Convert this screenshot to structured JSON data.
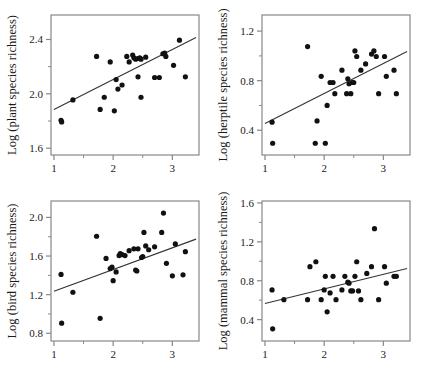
{
  "figure": {
    "background_color": "#ffffff",
    "point_color": "#111111",
    "line_color": "#333333",
    "axis_color": "#888888",
    "panel_count": 4
  },
  "chart_data": [
    {
      "type": "scatter",
      "title": "",
      "panel_name": "plant-species-richness",
      "xlabel": "",
      "ylabel": "Log (plant species richness)",
      "xlim": [
        0.95,
        3.45
      ],
      "ylim": [
        1.55,
        2.58
      ],
      "xticks": [
        1,
        2,
        3
      ],
      "xticklabels": [
        "1",
        "2",
        "3"
      ],
      "xminorticks": [
        1.5,
        2.5
      ],
      "yticks": [
        1.6,
        2.0,
        2.4
      ],
      "yticklabels": [
        "1.6",
        "2.0",
        "2.4"
      ],
      "yminorticks": [
        1.8,
        2.2
      ],
      "grid": false,
      "legend": "none",
      "regression": {
        "x": [
          1.0,
          3.4
        ],
        "y": [
          1.885,
          2.415
        ]
      },
      "points": [
        [
          1.12,
          1.805
        ],
        [
          1.13,
          1.793
        ],
        [
          1.32,
          1.955
        ],
        [
          1.72,
          2.275
        ],
        [
          1.78,
          1.885
        ],
        [
          1.85,
          1.975
        ],
        [
          1.95,
          2.235
        ],
        [
          2.02,
          1.875
        ],
        [
          2.05,
          2.105
        ],
        [
          2.08,
          2.035
        ],
        [
          2.15,
          2.065
        ],
        [
          2.23,
          2.275
        ],
        [
          2.27,
          2.235
        ],
        [
          2.33,
          2.285
        ],
        [
          2.35,
          2.265
        ],
        [
          2.38,
          2.255
        ],
        [
          2.42,
          2.26
        ],
        [
          2.45,
          2.265
        ],
        [
          2.47,
          2.255
        ],
        [
          2.47,
          1.975
        ],
        [
          2.42,
          2.125
        ],
        [
          2.55,
          2.27
        ],
        [
          2.7,
          2.12
        ],
        [
          2.78,
          2.12
        ],
        [
          2.84,
          2.295
        ],
        [
          2.87,
          2.3
        ],
        [
          2.89,
          2.275
        ],
        [
          3.02,
          2.21
        ],
        [
          3.12,
          2.395
        ],
        [
          3.22,
          2.125
        ]
      ]
    },
    {
      "type": "scatter",
      "title": "",
      "panel_name": "herptile-species-richness",
      "xlabel": "",
      "ylabel": "Log (herptile species richness)",
      "xlim": [
        0.95,
        3.45
      ],
      "ylim": [
        0.2,
        1.33
      ],
      "xticks": [
        1,
        2,
        3
      ],
      "xticklabels": [
        "1",
        "2",
        "3"
      ],
      "xminorticks": [
        1.5,
        2.5
      ],
      "yticks": [
        0.4,
        0.8,
        1.2
      ],
      "yticklabels": [
        "0.4",
        "0.8",
        "1.2"
      ],
      "yminorticks": [
        0.6,
        1.0
      ],
      "grid": false,
      "legend": "none",
      "regression": {
        "x": [
          1.0,
          3.4
        ],
        "y": [
          0.455,
          1.035
        ]
      },
      "points": [
        [
          1.12,
          0.465
        ],
        [
          1.13,
          0.295
        ],
        [
          1.72,
          1.075
        ],
        [
          1.85,
          0.295
        ],
        [
          1.88,
          0.475
        ],
        [
          1.95,
          0.835
        ],
        [
          2.02,
          0.295
        ],
        [
          2.05,
          0.6
        ],
        [
          2.1,
          0.785
        ],
        [
          2.15,
          0.785
        ],
        [
          2.18,
          0.695
        ],
        [
          2.3,
          0.885
        ],
        [
          2.38,
          0.695
        ],
        [
          2.4,
          0.815
        ],
        [
          2.42,
          0.775
        ],
        [
          2.45,
          0.695
        ],
        [
          2.47,
          0.785
        ],
        [
          2.5,
          0.785
        ],
        [
          2.52,
          1.04
        ],
        [
          2.55,
          0.995
        ],
        [
          2.62,
          0.885
        ],
        [
          2.7,
          0.935
        ],
        [
          2.8,
          1.015
        ],
        [
          2.84,
          1.04
        ],
        [
          2.88,
          0.995
        ],
        [
          2.92,
          0.695
        ],
        [
          3.02,
          0.995
        ],
        [
          3.05,
          0.835
        ],
        [
          3.18,
          0.885
        ],
        [
          3.22,
          0.695
        ]
      ]
    },
    {
      "type": "scatter",
      "title": "",
      "panel_name": "bird-species-richness",
      "xlabel": "",
      "ylabel": "Log (bird species richness)",
      "xlim": [
        0.95,
        3.45
      ],
      "ylim": [
        0.72,
        2.17
      ],
      "xticks": [
        1,
        2,
        3
      ],
      "xticklabels": [
        "1",
        "2",
        "3"
      ],
      "xminorticks": [
        1.5,
        2.5
      ],
      "yticks": [
        0.8,
        1.2,
        1.6,
        2.0
      ],
      "yticklabels": [
        "0.8",
        "1.2",
        "1.6",
        "2.0"
      ],
      "yminorticks": [
        1.0,
        1.4,
        1.8
      ],
      "grid": false,
      "legend": "none",
      "regression": {
        "x": [
          1.0,
          3.4
        ],
        "y": [
          1.235,
          1.775
        ]
      },
      "points": [
        [
          1.12,
          1.41
        ],
        [
          1.13,
          0.905
        ],
        [
          1.32,
          1.225
        ],
        [
          1.72,
          1.805
        ],
        [
          1.78,
          0.955
        ],
        [
          1.88,
          1.575
        ],
        [
          1.95,
          1.47
        ],
        [
          1.98,
          1.485
        ],
        [
          2.0,
          1.345
        ],
        [
          2.05,
          1.435
        ],
        [
          2.1,
          1.605
        ],
        [
          2.12,
          1.625
        ],
        [
          2.15,
          1.615
        ],
        [
          2.2,
          1.605
        ],
        [
          2.27,
          1.655
        ],
        [
          2.35,
          1.675
        ],
        [
          2.38,
          1.455
        ],
        [
          2.4,
          1.445
        ],
        [
          2.42,
          1.675
        ],
        [
          2.48,
          1.585
        ],
        [
          2.5,
          1.595
        ],
        [
          2.52,
          1.845
        ],
        [
          2.55,
          1.705
        ],
        [
          2.6,
          1.665
        ],
        [
          2.7,
          1.695
        ],
        [
          2.82,
          1.845
        ],
        [
          2.85,
          2.045
        ],
        [
          2.9,
          1.525
        ],
        [
          3.0,
          1.395
        ],
        [
          3.05,
          1.725
        ],
        [
          3.18,
          1.405
        ],
        [
          3.22,
          1.645
        ]
      ]
    },
    {
      "type": "scatter",
      "title": "",
      "panel_name": "mammal-species-richness",
      "xlabel": "",
      "ylabel": "Log (mammal species richness)",
      "xlim": [
        0.95,
        3.45
      ],
      "ylim": [
        0.18,
        1.62
      ],
      "xticks": [
        1,
        2,
        3
      ],
      "xticklabels": [
        "1",
        "2",
        "3"
      ],
      "xminorticks": [
        1.5,
        2.5
      ],
      "yticks": [
        0.4,
        0.8,
        1.2,
        1.6
      ],
      "yticklabels": [
        "0.4",
        "0.8",
        "1.2",
        "1.6"
      ],
      "yminorticks": [
        0.6,
        1.0,
        1.4
      ],
      "grid": false,
      "legend": "none",
      "regression": {
        "x": [
          1.0,
          3.4
        ],
        "y": [
          0.565,
          0.925
        ]
      },
      "points": [
        [
          1.12,
          0.705
        ],
        [
          1.13,
          0.305
        ],
        [
          1.32,
          0.605
        ],
        [
          1.72,
          0.605
        ],
        [
          1.76,
          0.945
        ],
        [
          1.86,
          0.995
        ],
        [
          1.95,
          0.605
        ],
        [
          2.0,
          0.705
        ],
        [
          2.02,
          0.845
        ],
        [
          2.05,
          0.48
        ],
        [
          2.1,
          0.675
        ],
        [
          2.15,
          0.845
        ],
        [
          2.2,
          0.605
        ],
        [
          2.3,
          0.705
        ],
        [
          2.35,
          0.845
        ],
        [
          2.4,
          0.785
        ],
        [
          2.42,
          0.775
        ],
        [
          2.45,
          0.695
        ],
        [
          2.48,
          0.695
        ],
        [
          2.52,
          0.845
        ],
        [
          2.55,
          0.995
        ],
        [
          2.58,
          0.695
        ],
        [
          2.62,
          0.605
        ],
        [
          2.72,
          0.875
        ],
        [
          2.8,
          0.945
        ],
        [
          2.85,
          1.335
        ],
        [
          2.92,
          0.605
        ],
        [
          3.02,
          0.945
        ],
        [
          3.05,
          0.775
        ],
        [
          3.18,
          0.845
        ],
        [
          3.22,
          0.845
        ]
      ]
    }
  ]
}
